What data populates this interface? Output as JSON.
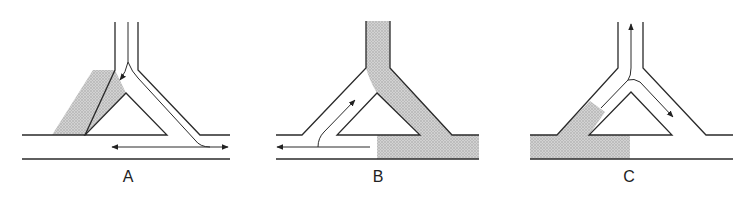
{
  "figure": {
    "shading_color": "#c6c6c6",
    "line_color": "#2a2a2a",
    "panels": [
      {
        "id": "A",
        "label": "A",
        "label_pos": [
          128,
          168
        ],
        "walls": [
          "M115,22 L115,70 L85,135 L22,135",
          "M138,22 L138,70 L200,135 L230,135",
          "M22,159 L230,159",
          "M126,93 L85,135 L167,135 Z"
        ],
        "shaded": [
          "M115,70 L93,70 L52,135 L85,135 L126,93 Z"
        ],
        "flow_paths": [
          {
            "d": "M128,22 L128,62 Q126,72 120,80",
            "arrow_end": true
          },
          {
            "d": "M128,62 Q132,72 138,78 L195,140 Q200,147 210,147 L228,147",
            "arrow_end": true
          },
          {
            "d": "M210,147 L112,147",
            "arrow_end": true
          }
        ]
      },
      {
        "id": "B",
        "label": "B",
        "label_pos": [
          378,
          168
        ],
        "walls": [
          "M366,21 L366,68 L302,135 L276,135",
          "M390,21 L390,68 L452,135 L479,135",
          "M276,159 L479,159",
          "M377,93 L337,135 L420,135 Z"
        ],
        "shaded": [
          "M366,21 L390,21 L390,68 L452,135 L479,135 L479,159 L377,159 L377,135 L420,135 L377,93 Q370,82 366,68 Z"
        ],
        "flow_paths": [
          {
            "d": "M318,147 Q318,138 324,132 L355,100",
            "arrow_end": true
          },
          {
            "d": "M370,147 L277,147",
            "arrow_end": true
          }
        ]
      },
      {
        "id": "C",
        "label": "C",
        "label_pos": [
          629,
          168
        ],
        "walls": [
          "M618,22 L618,68 L557,135 L530,135",
          "M643,22 L643,68 L706,135 L733,135",
          "M530,159 L733,159",
          "M631,92 L589,135 L672,135 Z"
        ],
        "shaded": [
          "M530,135 L557,135 L590,101 L605,112 L589,135 L630,135 L630,159 L530,159 Z"
        ],
        "flow_paths": [
          {
            "d": "M601,108 L628,80 Q631,76 631,68 L631,24",
            "arrow_end": true
          },
          {
            "d": "M628,80 Q634,78 640,82 L673,117",
            "arrow_end": true
          }
        ]
      }
    ]
  }
}
